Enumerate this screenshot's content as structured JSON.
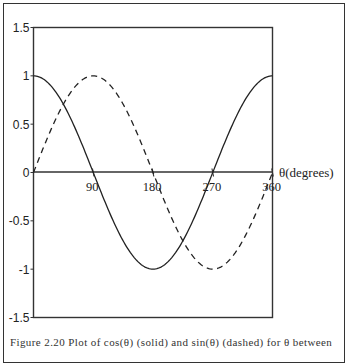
{
  "chart_data": {
    "type": "line",
    "title": "",
    "xlabel": "θ(degrees)",
    "ylabel": "",
    "xlim": [
      0,
      360
    ],
    "ylim": [
      -1.5,
      1.5
    ],
    "grid": false,
    "legend": null,
    "x_ticks": [
      90,
      180,
      270,
      360
    ],
    "x_tick_labels": [
      "90",
      "180",
      "270",
      "360"
    ],
    "y_ticks": [
      1.5,
      1,
      0.5,
      0,
      -0.5,
      -1,
      -1.5
    ],
    "y_tick_labels": [
      "1.5",
      "1",
      "0.5",
      "0",
      "-0.5",
      "-1",
      "-1.5"
    ],
    "x": [
      0,
      30,
      60,
      90,
      120,
      150,
      180,
      210,
      240,
      270,
      300,
      330,
      360
    ],
    "series": [
      {
        "name": "cos(θ)",
        "style": "solid",
        "values": [
          1,
          0.866,
          0.5,
          0,
          -0.5,
          -0.866,
          -1,
          -0.866,
          -0.5,
          0,
          0.5,
          0.866,
          1
        ]
      },
      {
        "name": "sin(θ)",
        "style": "dashed",
        "values": [
          0,
          0.5,
          0.866,
          1,
          0.866,
          0.5,
          0,
          -0.5,
          -0.866,
          -1,
          -0.866,
          -0.5,
          0
        ]
      }
    ]
  },
  "caption": "Figure 2.20   Plot of cos(θ) (solid) and sin(θ) (dashed) for θ between",
  "colors": {
    "line": "#222222",
    "axis": "#333333",
    "background": "#ffffff"
  }
}
